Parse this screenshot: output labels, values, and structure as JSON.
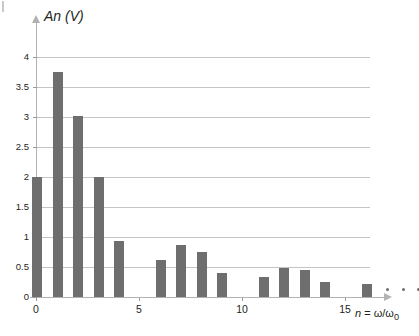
{
  "figure": {
    "corner_mark": "scan-artifact"
  },
  "chart_data": {
    "type": "bar",
    "title": "",
    "ylabel": "An (V)",
    "xlabel": "n = ω/ω₀",
    "xlabel_parts": {
      "variable": "n",
      "equals": " = ",
      "ratio": "ω/ω",
      "subscript": "0"
    },
    "categories": [
      0,
      1,
      2,
      3,
      4,
      5,
      6,
      7,
      8,
      9,
      10,
      11,
      12,
      13,
      14,
      15,
      16
    ],
    "values": [
      2.0,
      3.75,
      3.02,
      2.0,
      0.93,
      0,
      0.61,
      0.86,
      0.75,
      0.4,
      0,
      0.33,
      0.48,
      0.45,
      0.25,
      0,
      0.22
    ],
    "ylim": [
      0,
      4.2
    ],
    "xlim": [
      -0.6,
      17.4
    ],
    "yticks": [
      0,
      0.5,
      1,
      1.5,
      2,
      2.5,
      3,
      3.5,
      4
    ],
    "ytick_labels": [
      "0",
      "0.5",
      "1",
      "1.5",
      "2",
      "2.5",
      "3",
      "3.5",
      "4"
    ],
    "xticks": [
      0,
      5,
      10,
      15
    ],
    "xtick_labels": [
      "0",
      "5",
      "10",
      "15"
    ],
    "grid": "horizontal",
    "legend": "none",
    "annotations": [
      "• • • continuation ellipsis after n = 16"
    ],
    "colors": {
      "bar": "#6e6e6e",
      "gridline": "#c4c4c4",
      "axis": "#b2b2b2",
      "text": "#231f20",
      "background": "#ffffff"
    }
  }
}
